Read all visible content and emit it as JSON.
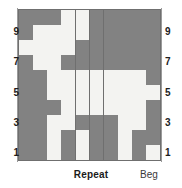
{
  "chart_data": {
    "type": "heatmap",
    "title": "",
    "xlabel": "",
    "ylabel": "",
    "grid": true,
    "legend_position": "none",
    "columns": 10,
    "rows": 10,
    "row_order": "bottom-to-top",
    "colors": {
      "dark": "#828282",
      "light": "#f3f3f1",
      "gridline": "#6f6f6f"
    },
    "value_legend": {
      "dark": "shaded stitch",
      "light": "blank stitch"
    },
    "row_labels_left": [
      "9",
      "7",
      "5",
      "3",
      "1"
    ],
    "row_labels_right": [
      "9",
      "7",
      "5",
      "3",
      "1"
    ],
    "labeled_rows": [
      9,
      7,
      5,
      3,
      1
    ],
    "cells": [
      [
        "dark",
        "dark",
        "dark",
        "light",
        "light",
        "dark",
        "dark",
        "dark",
        "dark",
        "dark"
      ],
      [
        "dark",
        "light",
        "light",
        "light",
        "light",
        "dark",
        "dark",
        "dark",
        "dark",
        "dark"
      ],
      [
        "light",
        "light",
        "light",
        "light",
        "dark",
        "dark",
        "dark",
        "dark",
        "dark",
        "dark"
      ],
      [
        "dark",
        "light",
        "light",
        "dark",
        "dark",
        "dark",
        "dark",
        "dark",
        "dark",
        "dark"
      ],
      [
        "dark",
        "dark",
        "light",
        "light",
        "light",
        "light",
        "light",
        "light",
        "light",
        "dark"
      ],
      [
        "dark",
        "dark",
        "light",
        "light",
        "light",
        "light",
        "light",
        "light",
        "light",
        "light"
      ],
      [
        "dark",
        "dark",
        "dark",
        "light",
        "light",
        "light",
        "light",
        "light",
        "light",
        "dark"
      ],
      [
        "dark",
        "dark",
        "light",
        "light",
        "dark",
        "dark",
        "dark",
        "light",
        "light",
        "dark"
      ],
      [
        "dark",
        "dark",
        "light",
        "dark",
        "light",
        "dark",
        "dark",
        "light",
        "dark",
        "dark"
      ],
      [
        "dark",
        "dark",
        "light",
        "dark",
        "light",
        "dark",
        "dark",
        "light",
        "dark",
        "light"
      ]
    ]
  },
  "footer": {
    "repeat_label": "Repeat",
    "beg_label": "Beg"
  }
}
